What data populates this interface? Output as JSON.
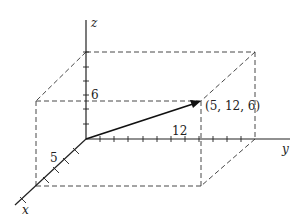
{
  "diagram": {
    "axes": {
      "x": "x",
      "y": "y",
      "z": "z"
    },
    "ticks": {
      "x_label": "5",
      "y_label": "12",
      "z_label": "6"
    },
    "point": {
      "label": "(5, 12, 6)",
      "coords": [
        5,
        12,
        6
      ]
    }
  }
}
